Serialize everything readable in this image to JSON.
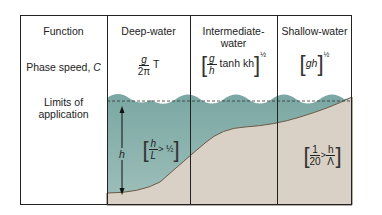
{
  "colors": {
    "water": "#8fb5b0",
    "water_dark": "#6f9e9a",
    "seabed": "#d8d0c4",
    "seabed_line": "#6b5a48",
    "border": "#222222"
  },
  "rows": {
    "function": "Function",
    "phase_speed": "Phase speed, ",
    "phase_speed_var": "C",
    "limits_line1": "Limits of",
    "limits_line2": "application"
  },
  "columns": [
    {
      "title": "Deep-water",
      "formula_num": "g",
      "formula_den": "2π",
      "formula_tail": "T"
    },
    {
      "title_line1": "Intermediate-",
      "title_line2": "water",
      "formula_num": "g",
      "formula_den": "h",
      "formula_tail": "tanh kh",
      "exponent": "½"
    },
    {
      "title": "Shallow-water",
      "formula_body": "gh",
      "exponent": "½"
    }
  ],
  "limits": {
    "deep": {
      "depth_label": "h",
      "num": "h",
      "den": "L",
      "rel": "> ½"
    },
    "shallow": {
      "num": "1",
      "den": "20",
      "rel": ">",
      "num2": "h",
      "den2": "Λ"
    }
  }
}
